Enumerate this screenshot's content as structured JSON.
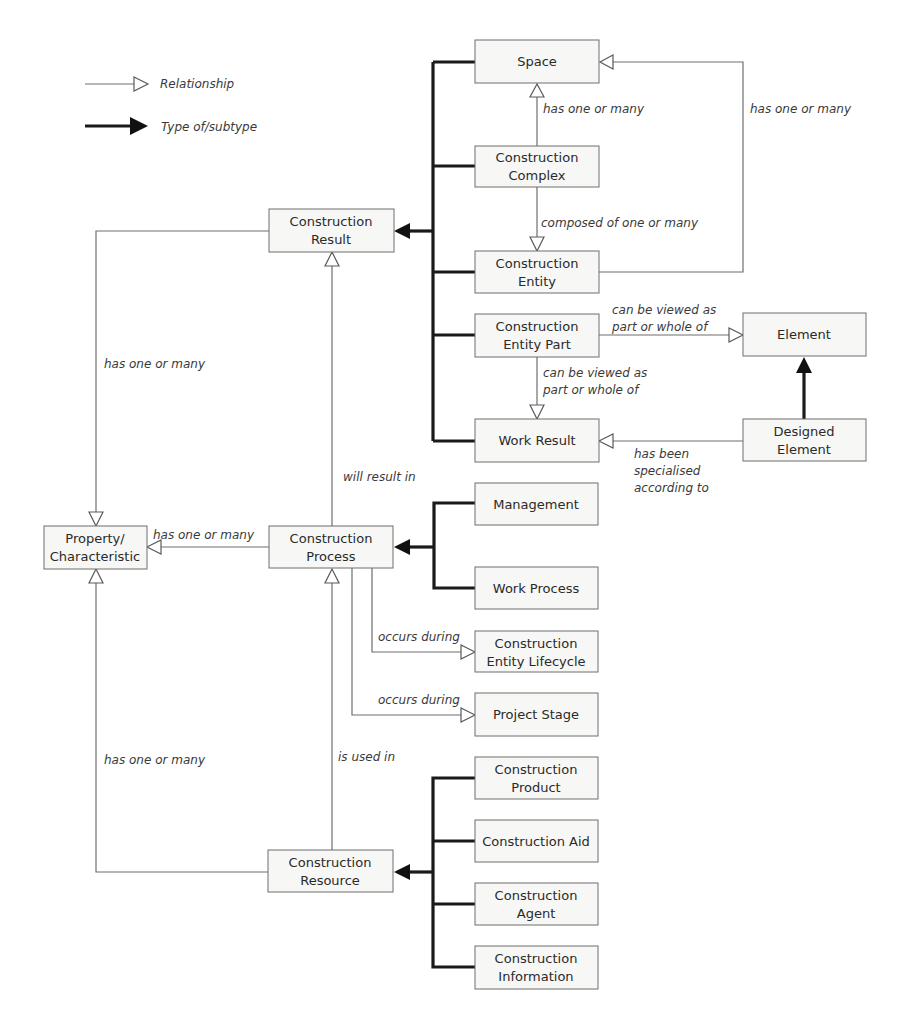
{
  "legend": {
    "relationship": "Relationship",
    "type_of_subtype": "Type of/subtype"
  },
  "nodes": {
    "space": [
      "Space"
    ],
    "construction_complex": [
      "Construction",
      "Complex"
    ],
    "construction_result": [
      "Construction",
      "Result"
    ],
    "construction_entity": [
      "Construction",
      "Entity"
    ],
    "construction_entity_part": [
      "Construction",
      "Entity Part"
    ],
    "element": [
      "Element"
    ],
    "work_result": [
      "Work Result"
    ],
    "designed_element": [
      "Designed",
      "Element"
    ],
    "property_characteristic": [
      "Property/",
      "Characteristic"
    ],
    "construction_process": [
      "Construction",
      "Process"
    ],
    "management": [
      "Management"
    ],
    "work_process": [
      "Work Process"
    ],
    "construction_entity_lifecycle": [
      "Construction",
      "Entity Lifecycle"
    ],
    "project_stage": [
      "Project Stage"
    ],
    "construction_product": [
      "Construction",
      "Product"
    ],
    "construction_aid": [
      "Construction Aid"
    ],
    "construction_agent": [
      "Construction",
      "Agent"
    ],
    "construction_information": [
      "Construction",
      "Information"
    ],
    "construction_resource": [
      "Construction",
      "Resource"
    ]
  },
  "edge_labels": {
    "complex_to_space": "has one or many",
    "entity_to_space": "has one or many",
    "complex_to_entity": "composed of one or many",
    "part_to_element": [
      "can be viewed as",
      "part or whole of"
    ],
    "part_to_work_result": [
      "can be viewed as",
      "part or whole of"
    ],
    "designed_to_work_result": [
      "has been",
      "specialised",
      "according to"
    ],
    "result_to_property": "has one or many",
    "process_to_result": "will result in",
    "process_to_property": "has one or many",
    "process_to_lifecycle": "occurs during",
    "process_to_stage": "occurs during",
    "resource_to_property": "has one or many",
    "resource_to_process": "is used in"
  }
}
